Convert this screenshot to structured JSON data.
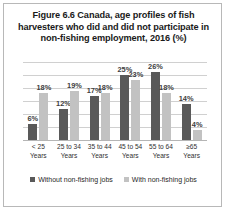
{
  "figure": {
    "title": "Figure 6.6 Canada, age profiles of fish harvesters who did and did not participate in non-fishing employment, 2016 (%)"
  },
  "legend": {
    "entries": [
      {
        "label": "Without non-fishing jobs",
        "color": "#595959"
      },
      {
        "label": "With non-fishing jobs",
        "color": "#c2c2c2"
      }
    ]
  },
  "chart_data": {
    "type": "bar",
    "title": "Figure 6.6 Canada, age profiles of fish harvesters who did and did not participate in non-fishing employment, 2016 (%)",
    "xlabel": "",
    "ylabel": "",
    "ylim": [
      0,
      30
    ],
    "grid": true,
    "gridlines": [
      0,
      5,
      10,
      15,
      20,
      25,
      30
    ],
    "y_tick_labels_visible": false,
    "legend_position": "bottom",
    "categories": [
      "< 25 Years",
      "25 to 34 Years",
      "35 to 44 Years",
      "45 to 54 Years",
      "55 to 64 Years",
      "≥65 Years"
    ],
    "category_lines": [
      [
        "< 25",
        "Years"
      ],
      [
        "25 to 34",
        "Years"
      ],
      [
        "35 to 44",
        "Years"
      ],
      [
        "45 to 54",
        "Years"
      ],
      [
        "55 to 64",
        "Years"
      ],
      [
        "≥65",
        "Years"
      ]
    ],
    "series": [
      {
        "name": "Without non-fishing jobs",
        "color": "#595959",
        "values": [
          6,
          12,
          17,
          25,
          26,
          14
        ],
        "labels": [
          "6%",
          "12%",
          "17%",
          "25%",
          "26%",
          "14%"
        ]
      },
      {
        "name": "With non-fishing jobs",
        "color": "#c2c2c2",
        "values": [
          18,
          19,
          18,
          23,
          18,
          4
        ],
        "labels": [
          "18%",
          "19%",
          "18%",
          "23%",
          "18%",
          "4%"
        ]
      }
    ]
  }
}
